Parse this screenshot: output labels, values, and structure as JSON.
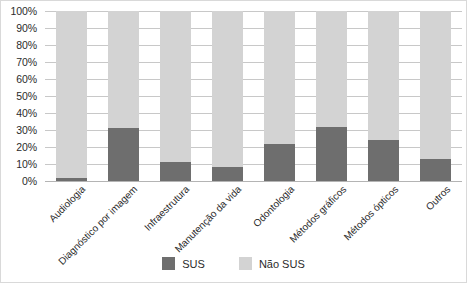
{
  "chart_data": {
    "type": "bar",
    "subtype": "stacked-100-percent",
    "title": "",
    "xlabel": "",
    "ylabel": "",
    "ylim": [
      0,
      100
    ],
    "ytick_labels": [
      "100%",
      "90%",
      "80%",
      "70%",
      "60%",
      "50%",
      "40%",
      "30%",
      "20%",
      "10%",
      "0%"
    ],
    "ytick_values": [
      100,
      90,
      80,
      70,
      60,
      50,
      40,
      30,
      20,
      10,
      0
    ],
    "grid": true,
    "legend_position": "bottom-center",
    "categories": [
      "Audiologia",
      "Diagnóstico por imagem",
      "Infraestrutura",
      "Manutenção da vida",
      "Odontologia",
      "Métodos gráficos",
      "Métodos ópticos",
      "Outros"
    ],
    "series": [
      {
        "name": "SUS",
        "color": "#6e6e6e",
        "values": [
          2,
          31,
          11,
          8,
          22,
          32,
          24,
          13
        ]
      },
      {
        "name": "Não SUS",
        "color": "#d3d3d3",
        "values": [
          98,
          69,
          89,
          92,
          78,
          68,
          76,
          87
        ]
      }
    ]
  },
  "legend": {
    "items": [
      {
        "label": "SUS",
        "color": "#6e6e6e"
      },
      {
        "label": "Não SUS",
        "color": "#d3d3d3"
      }
    ]
  },
  "colors": {
    "sus": "#6e6e6e",
    "nao_sus": "#d3d3d3",
    "gridline": "#c8c8c8",
    "text": "#2b2b2b",
    "border": "#d9d9d9",
    "background": "#ffffff"
  }
}
